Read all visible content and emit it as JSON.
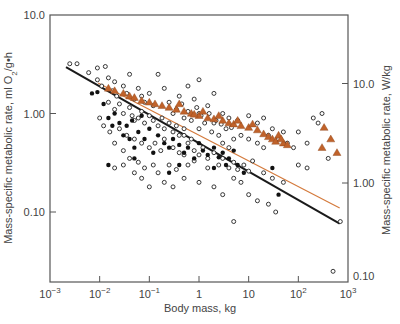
{
  "chart_data": {
    "type": "scatter",
    "title": "",
    "xlabel": "Body mass, kg",
    "ylabel_left": "Mass-specific metabolic rate, ml O2/g•h",
    "ylabel_right": "Mass-specific metabolic rate, W/kg",
    "xscale": "log",
    "yscale": "log",
    "xlim": [
      0.001,
      1000
    ],
    "ylim_left": [
      0.0158,
      10.0
    ],
    "ylim_right": [
      0.1,
      80
    ],
    "x_ticks": [
      {
        "value": 0.001,
        "base": "10",
        "exp": "−3"
      },
      {
        "value": 0.01,
        "base": "10",
        "exp": "−2"
      },
      {
        "value": 0.1,
        "base": "10",
        "exp": "−1"
      },
      {
        "value": 1,
        "base": "1",
        "exp": ""
      },
      {
        "value": 10,
        "base": "10",
        "exp": ""
      },
      {
        "value": 100,
        "base": "10",
        "exp": "2"
      },
      {
        "value": 1000,
        "base": "10",
        "exp": "3"
      }
    ],
    "y_ticks_left": [
      {
        "value": 10.0,
        "label": "10.0"
      },
      {
        "value": 1.0,
        "label": "1.00"
      },
      {
        "value": 0.1,
        "label": "0.10"
      }
    ],
    "y_ticks_right": [
      {
        "value": 10.0,
        "label": "10.0"
      },
      {
        "value": 1.0,
        "label": "1.00"
      },
      {
        "value": 0.1,
        "label": "0.10"
      }
    ],
    "grid": false,
    "legend": null,
    "colors": {
      "axis": "#555555",
      "open_circle": "#222222",
      "filled_circle": "#111111",
      "triangle": "#c0622a",
      "orange_line": "#d47a3c",
      "black_line": "#1a1a1a"
    },
    "series": [
      {
        "name": "Open circles (species)",
        "marker": "open-circle",
        "points": [
          [
            0.0025,
            3.2
          ],
          [
            0.0035,
            3.2
          ],
          [
            0.006,
            2.6
          ],
          [
            0.009,
            2.9
          ],
          [
            0.013,
            3.0
          ],
          [
            0.009,
            2.2
          ],
          [
            0.011,
            1.9
          ],
          [
            0.015,
            2.3
          ],
          [
            0.02,
            2.1
          ],
          [
            0.018,
            1.7
          ],
          [
            0.022,
            1.5
          ],
          [
            0.03,
            1.9
          ],
          [
            0.04,
            2.5
          ],
          [
            0.035,
            1.6
          ],
          [
            0.05,
            1.4
          ],
          [
            0.06,
            1.8
          ],
          [
            0.07,
            1.5
          ],
          [
            0.08,
            1.3
          ],
          [
            0.1,
            1.6
          ],
          [
            0.12,
            1.2
          ],
          [
            0.015,
            1.3
          ],
          [
            0.02,
            1.1
          ],
          [
            0.025,
            1.25
          ],
          [
            0.03,
            1.0
          ],
          [
            0.04,
            1.15
          ],
          [
            0.045,
            0.95
          ],
          [
            0.05,
            0.85
          ],
          [
            0.06,
            0.9
          ],
          [
            0.07,
            1.05
          ],
          [
            0.08,
            0.8
          ],
          [
            0.1,
            0.95
          ],
          [
            0.12,
            0.85
          ],
          [
            0.15,
            0.75
          ],
          [
            0.18,
            0.9
          ],
          [
            0.2,
            0.7
          ],
          [
            0.25,
            0.8
          ],
          [
            0.3,
            0.65
          ],
          [
            0.35,
            0.75
          ],
          [
            0.4,
            0.6
          ],
          [
            0.5,
            0.7
          ],
          [
            0.01,
            0.9
          ],
          [
            0.012,
            0.75
          ],
          [
            0.016,
            0.65
          ],
          [
            0.025,
            0.7
          ],
          [
            0.035,
            0.6
          ],
          [
            0.05,
            0.55
          ],
          [
            0.07,
            0.5
          ],
          [
            0.1,
            0.45
          ],
          [
            0.13,
            0.5
          ],
          [
            0.17,
            0.42
          ],
          [
            0.2,
            0.55
          ],
          [
            0.3,
            0.45
          ],
          [
            0.4,
            0.4
          ],
          [
            0.5,
            0.38
          ],
          [
            0.6,
            0.5
          ],
          [
            0.8,
            0.42
          ],
          [
            1.0,
            0.38
          ],
          [
            1.2,
            0.45
          ],
          [
            1.5,
            0.35
          ],
          [
            2.0,
            0.4
          ],
          [
            0.02,
            0.5
          ],
          [
            0.03,
            0.42
          ],
          [
            0.04,
            0.35
          ],
          [
            0.06,
            0.32
          ],
          [
            0.08,
            0.28
          ],
          [
            0.12,
            0.3
          ],
          [
            0.15,
            0.25
          ],
          [
            0.25,
            0.3
          ],
          [
            0.35,
            0.27
          ],
          [
            0.6,
            0.3
          ],
          [
            0.8,
            0.33
          ],
          [
            1.5,
            0.28
          ],
          [
            2.5,
            0.3
          ],
          [
            3.0,
            0.35
          ],
          [
            4.0,
            0.28
          ],
          [
            5.0,
            0.32
          ],
          [
            6.0,
            0.27
          ],
          [
            8.0,
            0.3
          ],
          [
            10,
            0.26
          ],
          [
            12,
            0.33
          ],
          [
            0.3,
            1.0
          ],
          [
            0.5,
            0.9
          ],
          [
            0.7,
            0.85
          ],
          [
            1.0,
            0.7
          ],
          [
            1.3,
            0.8
          ],
          [
            1.8,
            0.65
          ],
          [
            2.5,
            0.6
          ],
          [
            3.5,
            0.7
          ],
          [
            5.0,
            0.55
          ],
          [
            7.0,
            0.6
          ],
          [
            0.8,
            1.4
          ],
          [
            1.5,
            1.2
          ],
          [
            3.0,
            1.0
          ],
          [
            4.0,
            0.9
          ],
          [
            6.0,
            0.85
          ],
          [
            10,
            0.95
          ],
          [
            15,
            0.8
          ],
          [
            20,
            0.9
          ],
          [
            30,
            0.7
          ],
          [
            50,
            0.65
          ],
          [
            0.2,
            1.8
          ],
          [
            0.4,
            1.5
          ],
          [
            1.0,
            2.2
          ],
          [
            2.0,
            1.6
          ],
          [
            0.15,
            2.5
          ],
          [
            0.6,
            1.9
          ],
          [
            1.0,
            1.0
          ],
          [
            2.0,
            0.8
          ],
          [
            3.0,
            0.5
          ],
          [
            4.0,
            0.45
          ],
          [
            10,
            0.55
          ],
          [
            15,
            0.5
          ],
          [
            20,
            0.45
          ],
          [
            25,
            0.6
          ],
          [
            40,
            0.55
          ],
          [
            60,
            0.5
          ],
          [
            80,
            0.45
          ],
          [
            100,
            0.65
          ],
          [
            150,
            0.5
          ],
          [
            200,
            0.9
          ],
          [
            250,
            0.8
          ],
          [
            300,
            1.0
          ],
          [
            100,
            0.3
          ],
          [
            150,
            0.28
          ],
          [
            400,
            0.35
          ],
          [
            50,
            0.2
          ],
          [
            30,
            0.22
          ],
          [
            20,
            0.25
          ],
          [
            7.0,
            0.2
          ],
          [
            5.0,
            0.22
          ],
          [
            3.0,
            0.15
          ],
          [
            2.0,
            0.18
          ],
          [
            1.0,
            0.2
          ],
          [
            0.5,
            0.22
          ],
          [
            0.3,
            0.18
          ],
          [
            0.2,
            0.2
          ],
          [
            0.1,
            0.18
          ],
          [
            0.07,
            0.22
          ],
          [
            0.05,
            0.25
          ],
          [
            0.03,
            0.3
          ],
          [
            0.02,
            0.28
          ],
          [
            10,
            0.15
          ],
          [
            15,
            0.13
          ],
          [
            25,
            0.12
          ],
          [
            35,
            0.1
          ],
          [
            5,
            0.08
          ],
          [
            700,
            0.08
          ],
          [
            500,
            0.025
          ],
          [
            0.5,
            0.6
          ],
          [
            0.7,
            0.55
          ],
          [
            0.25,
            1.3
          ],
          [
            0.35,
            1.1
          ],
          [
            0.45,
            1.25
          ],
          [
            0.6,
            1.05
          ],
          [
            0.9,
            1.15
          ],
          [
            1.1,
            0.95
          ],
          [
            1.6,
            1.0
          ],
          [
            2.2,
            0.85
          ],
          [
            2.8,
            0.78
          ],
          [
            4.5,
            0.72
          ]
        ]
      },
      {
        "name": "Filled circles",
        "marker": "filled-circle",
        "points": [
          [
            0.007,
            1.6
          ],
          [
            0.009,
            1.65
          ],
          [
            0.012,
            1.25
          ],
          [
            0.015,
            0.9
          ],
          [
            0.02,
            1.0
          ],
          [
            0.025,
            0.8
          ],
          [
            0.03,
            0.6
          ],
          [
            0.035,
            0.75
          ],
          [
            0.04,
            0.55
          ],
          [
            0.05,
            0.45
          ],
          [
            0.06,
            0.65
          ],
          [
            0.08,
            0.55
          ],
          [
            0.1,
            0.7
          ],
          [
            0.12,
            0.4
          ],
          [
            0.15,
            0.6
          ],
          [
            0.2,
            0.5
          ],
          [
            0.25,
            0.45
          ],
          [
            0.3,
            0.55
          ],
          [
            0.4,
            0.48
          ],
          [
            0.5,
            0.4
          ],
          [
            0.6,
            0.45
          ],
          [
            0.8,
            0.35
          ],
          [
            1.0,
            0.5
          ],
          [
            1.2,
            0.42
          ],
          [
            1.5,
            0.38
          ],
          [
            2.0,
            0.45
          ],
          [
            2.5,
            0.36
          ],
          [
            3.0,
            0.4
          ],
          [
            3.5,
            0.3
          ],
          [
            4.0,
            0.35
          ],
          [
            5.0,
            0.42
          ],
          [
            6.0,
            0.3
          ],
          [
            0.05,
            0.35
          ],
          [
            0.015,
            0.3
          ],
          [
            0.25,
            0.25
          ],
          [
            0.4,
            0.3
          ],
          [
            0.018,
            0.75
          ],
          [
            0.045,
            0.85
          ],
          [
            0.07,
            0.95
          ],
          [
            30,
            0.28
          ],
          [
            40,
            0.15
          ],
          [
            8.0,
            0.25
          ],
          [
            2.0,
            0.28
          ]
        ]
      },
      {
        "name": "Triangles",
        "marker": "triangle",
        "points": [
          [
            0.015,
            1.8
          ],
          [
            0.02,
            1.7
          ],
          [
            0.03,
            1.6
          ],
          [
            0.04,
            1.5
          ],
          [
            0.05,
            1.45
          ],
          [
            0.07,
            1.35
          ],
          [
            0.1,
            1.3
          ],
          [
            0.13,
            1.25
          ],
          [
            0.18,
            1.2
          ],
          [
            0.25,
            1.15
          ],
          [
            0.35,
            1.1
          ],
          [
            0.5,
            1.05
          ],
          [
            0.7,
            1.0
          ],
          [
            1.0,
            0.95
          ],
          [
            1.5,
            0.9
          ],
          [
            2.0,
            0.88
          ],
          [
            3.0,
            0.85
          ],
          [
            4.0,
            0.8
          ],
          [
            5.0,
            0.78
          ],
          [
            7.0,
            0.75
          ],
          [
            10,
            0.72
          ],
          [
            15,
            0.68
          ],
          [
            20,
            0.62
          ],
          [
            25,
            0.58
          ],
          [
            30,
            0.55
          ],
          [
            40,
            0.6
          ],
          [
            50,
            0.5
          ],
          [
            60,
            0.48
          ],
          [
            35,
            0.52
          ],
          [
            45,
            0.55
          ],
          [
            330,
            0.72
          ],
          [
            450,
            0.55
          ],
          [
            300,
            0.45
          ],
          [
            600,
            0.4
          ],
          [
            1.2,
            1.05
          ],
          [
            0.8,
            0.98
          ],
          [
            2.5,
            0.95
          ],
          [
            6.0,
            0.85
          ],
          [
            12,
            0.78
          ],
          [
            0.4,
            1.25
          ]
        ]
      },
      {
        "name": "Fit line (all species)",
        "marker": "line-black",
        "points": [
          [
            0.0021,
            2.95
          ],
          [
            680,
            0.076
          ]
        ]
      },
      {
        "name": "Fit line (triangles)",
        "marker": "line-orange",
        "points": [
          [
            0.0093,
            2.04
          ],
          [
            680,
            0.11
          ]
        ]
      }
    ]
  }
}
